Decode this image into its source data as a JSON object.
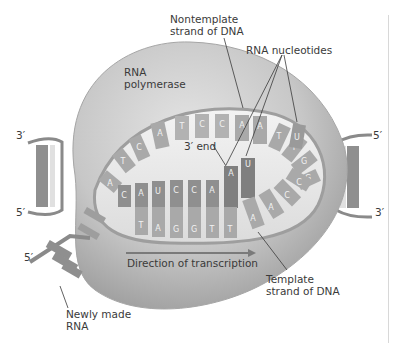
{
  "figure": {
    "labels": {
      "rna_polymerase": [
        "RNA",
        "polymerase"
      ],
      "nontemplate_strand": [
        "Nontemplate",
        "strand of DNA"
      ],
      "rna_nucleotides": "RNA nucleotides",
      "three_prime_end": "3′ end",
      "direction": "Direction of transcription",
      "template_strand": [
        "Template",
        "strand of DNA"
      ],
      "newly_made_rna": [
        "Newly made",
        "RNA"
      ]
    },
    "strand_ends": {
      "left_top": "3′",
      "left_bottom": "5′",
      "right_top": "5′",
      "right_bottom": "3′",
      "rna_5prime": "5′"
    },
    "nontemplate_sequence": [
      "A",
      "T",
      "C",
      "A",
      "T",
      "C",
      "C",
      "A",
      "A",
      "T",
      "T",
      "G",
      "G"
    ],
    "rna_sequence": [
      "C",
      "A",
      "U",
      "C",
      "C",
      "A",
      "A",
      "U"
    ],
    "template_sequence": [
      "T",
      "A",
      "G",
      "G",
      "T",
      "T",
      "A",
      "A",
      "C",
      "C"
    ],
    "free_nucleotide": "U",
    "colors": {
      "enzyme": "#c9c9c9",
      "enzyme_shadow": "#9a9a9a",
      "backbone": "#8a8a8a",
      "base_dark": "#8f8f8f",
      "base_light": "#b5b5b5",
      "text": "#3a3a3a"
    }
  }
}
